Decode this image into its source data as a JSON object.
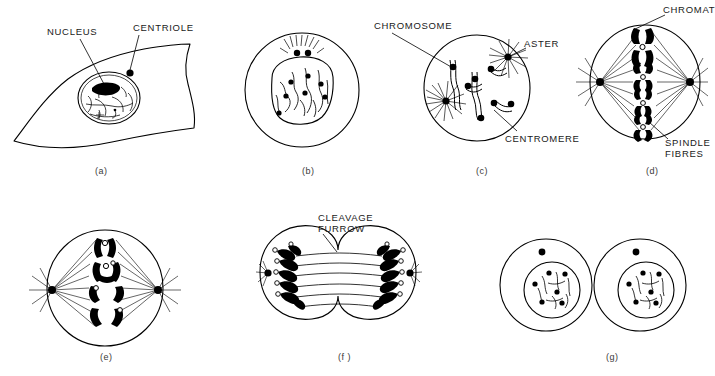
{
  "figure": {
    "background_color": "#ffffff",
    "ink_color": "#000000",
    "width": 708,
    "height": 376
  },
  "panels": [
    {
      "id": "a",
      "caption": "(a)",
      "stage": "interphase-flat-cell",
      "caption_x": 95,
      "caption_y": 166
    },
    {
      "id": "b",
      "caption": "(b)",
      "stage": "early-prophase",
      "caption_x": 302,
      "caption_y": 166
    },
    {
      "id": "c",
      "caption": "(c)",
      "stage": "late-prophase",
      "caption_x": 476,
      "caption_y": 166
    },
    {
      "id": "d",
      "caption": "(d)",
      "stage": "metaphase",
      "caption_x": 646,
      "caption_y": 166
    },
    {
      "id": "e",
      "caption": "(e)",
      "stage": "anaphase",
      "caption_x": 100,
      "caption_y": 352
    },
    {
      "id": "f",
      "caption": "(f )",
      "stage": "telophase-cytokinesis",
      "caption_x": 338,
      "caption_y": 352
    },
    {
      "id": "g",
      "caption": "(g)",
      "stage": "daughter-cells",
      "caption_x": 606,
      "caption_y": 352
    }
  ],
  "annotations": [
    {
      "name": "nucleus",
      "text": "NUCLEUS",
      "panel": "a",
      "x": 47,
      "y": 26,
      "leader": {
        "x1": 80,
        "y1": 39,
        "x2": 104,
        "y2": 84
      }
    },
    {
      "name": "centriole",
      "text": "CENTRIOLE",
      "panel": "a",
      "x": 133,
      "y": 22,
      "leader": {
        "x1": 139,
        "y1": 35,
        "x2": 130,
        "y2": 70
      }
    },
    {
      "name": "chromosome",
      "text": "CHROMOSOME",
      "panel": "c",
      "x": 374,
      "y": 20,
      "leader": {
        "x1": 392,
        "y1": 33,
        "x2": 453,
        "y2": 68
      }
    },
    {
      "name": "aster",
      "text": "ASTER",
      "panel": "c",
      "x": 524,
      "y": 38,
      "leader": {
        "x1": 526,
        "y1": 48,
        "x2": 508,
        "y2": 57
      }
    },
    {
      "name": "centromere",
      "text": "CENTROMERE",
      "panel": "c",
      "x": 505,
      "y": 133,
      "leader": {
        "x1": 517,
        "y1": 131,
        "x2": 494,
        "y2": 110
      }
    },
    {
      "name": "chromatid",
      "text": "CHROMAT",
      "panel": "d",
      "x": 663,
      "y": 4,
      "leader": {
        "x1": 665,
        "y1": 15,
        "x2": 633,
        "y2": 30
      }
    },
    {
      "name": "spindle-fibres",
      "text": "SPINDLE",
      "text2": "FIBRES",
      "panel": "d",
      "x": 665,
      "y": 137,
      "leader": {
        "x1": 668,
        "y1": 139,
        "x2": 649,
        "y2": 122
      }
    },
    {
      "name": "cleavage-furrow",
      "text": "CLEAVAGE",
      "text2": "FURROW",
      "panel": "f",
      "x": 318,
      "y": 212,
      "leader": {
        "x1": 323,
        "y1": 234,
        "x2": 336,
        "y2": 252
      }
    }
  ]
}
